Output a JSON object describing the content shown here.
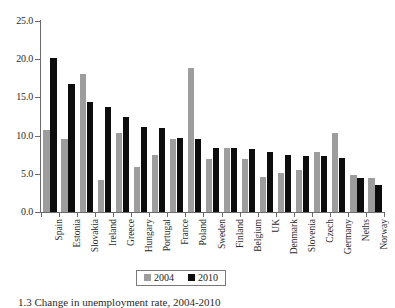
{
  "figure": {
    "caption": "1.3  Change in unemployment rate, 2004-2010"
  },
  "legend": {
    "position": "bottom-center",
    "entries": [
      {
        "label": "2004",
        "color": "#9d9d9d"
      },
      {
        "label": "2010",
        "color": "#0d0d0d"
      }
    ]
  },
  "axes": {
    "y_ticks": [
      "0.0",
      "5.0",
      "10.0",
      "15.0",
      "20.0",
      "25.0"
    ]
  },
  "chart_data": {
    "type": "bar",
    "title": "",
    "xlabel": "",
    "ylabel": "",
    "ylim": [
      0.0,
      25.0
    ],
    "ytick_step": 5.0,
    "grid": false,
    "legend_position": "bottom-center",
    "categories": [
      "Spain",
      "Estonia",
      "Slovakia",
      "Ireland",
      "Greece",
      "Hungary",
      "Portugal",
      "France",
      "Poland",
      "Sweden",
      "Finland",
      "Belgium",
      "UK",
      "Denmark",
      "Slovenia",
      "Czech",
      "Germany",
      "Neths",
      "Norway"
    ],
    "series": [
      {
        "name": "2004",
        "color": "#9d9d9d",
        "values": [
          10.8,
          9.5,
          18.1,
          4.2,
          10.3,
          5.9,
          7.5,
          9.6,
          18.9,
          7.0,
          8.4,
          7.0,
          4.6,
          5.1,
          5.5,
          7.9,
          10.3,
          4.9,
          4.4
        ]
      },
      {
        "name": "2010",
        "color": "#0d0d0d",
        "values": [
          20.1,
          16.8,
          14.4,
          13.7,
          12.5,
          11.1,
          11.0,
          9.7,
          9.6,
          8.4,
          8.4,
          8.3,
          7.8,
          7.5,
          7.3,
          7.3,
          7.1,
          4.5,
          3.6
        ]
      }
    ]
  }
}
